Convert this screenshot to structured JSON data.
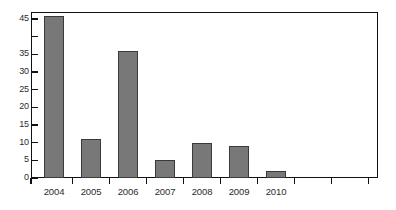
{
  "chart_data": {
    "type": "bar",
    "title": "",
    "subtitle": "",
    "xlabel": "",
    "ylabel": "",
    "categories": [
      "2004",
      "2005",
      "2006",
      "2007",
      "2008",
      "2009",
      "2010"
    ],
    "values": [
      46,
      11,
      36,
      5,
      10,
      9,
      2
    ],
    "ylim": [
      0,
      47
    ],
    "y_ticks": [
      0,
      5,
      10,
      15,
      20,
      25,
      30,
      35,
      40,
      45
    ],
    "y_tick_labels": [
      "0",
      "5",
      "10",
      "15",
      "20",
      "25",
      "30",
      "35",
      "",
      "45"
    ],
    "extra_unlabeled_x_ticks": 2,
    "grid": false,
    "legend": null,
    "annotations": [],
    "colors": {
      "bar_fill": "#787878",
      "bar_border": "#3a3a3a",
      "axis": "#111111",
      "text": "#2b2b2b",
      "background": "#ffffff"
    }
  }
}
